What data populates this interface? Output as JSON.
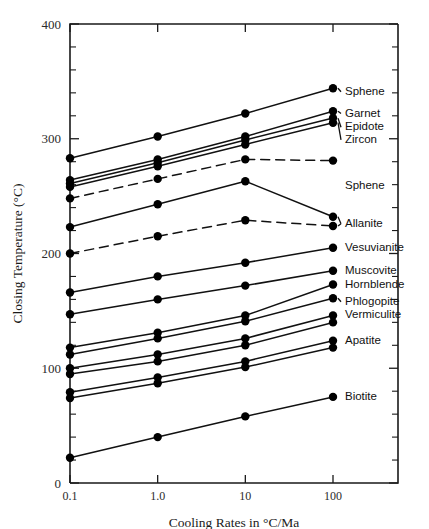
{
  "chart_data": {
    "type": "line",
    "title": "",
    "xlabel": "Cooling Rates in °C/Ma",
    "ylabel": "Closing Temperature (°C)",
    "xscale": "log",
    "xlim": [
      0.1,
      100
    ],
    "ylim": [
      0,
      400
    ],
    "x": [
      0.1,
      1.0,
      10,
      100
    ],
    "xticks": [
      "0.1",
      "1.0",
      "10",
      "100"
    ],
    "yticks": [
      "0",
      "100",
      "200",
      "300",
      "400"
    ],
    "ytick_values": [
      0,
      100,
      200,
      300,
      400
    ],
    "y_minor_interval": 20,
    "grid": false,
    "legend": "right-inline-labels",
    "series": [
      {
        "name": "Sphene",
        "label": "Sphene",
        "style": "solid",
        "values": [
          283,
          302,
          322,
          344
        ],
        "label_y": 341,
        "leader": true
      },
      {
        "name": "Garnet",
        "label": "Garnet",
        "style": "solid",
        "values": [
          264,
          282,
          302,
          324
        ],
        "label_y": 322,
        "leader": true
      },
      {
        "name": "Epidote",
        "label": "Epidote",
        "style": "solid",
        "values": [
          261,
          279,
          299,
          318
        ],
        "label_y": 310,
        "leader": true
      },
      {
        "name": "Zircon",
        "label": "Zircon",
        "style": "solid",
        "values": [
          258,
          276,
          295,
          314
        ],
        "label_y": 299,
        "leader": true
      },
      {
        "name": "Sphene-2",
        "label": "Sphene",
        "style": "dashed",
        "values": [
          248,
          265,
          282,
          281
        ],
        "label_y": 259,
        "leader": false
      },
      {
        "name": "Allanite-hi",
        "label": "Allanite",
        "style": "solid",
        "values": [
          223,
          243,
          263,
          232
        ],
        "label_y": 226,
        "leader": true
      },
      {
        "name": "Allanite-lo",
        "label": "",
        "style": "dashed",
        "values": [
          200,
          215,
          229,
          224
        ],
        "label_y": 0,
        "leader": false
      },
      {
        "name": "Vesuvianite",
        "label": "Vesuvianite",
        "style": "solid",
        "values": [
          166,
          180,
          192,
          205
        ],
        "label_y": 205,
        "leader": false
      },
      {
        "name": "Muscovite",
        "label": "Muscovite",
        "style": "solid",
        "values": [
          147,
          160,
          172,
          185
        ],
        "label_y": 185,
        "leader": false
      },
      {
        "name": "Hornblende",
        "label": "Hornblende",
        "style": "solid",
        "values": [
          118,
          131,
          146,
          173
        ],
        "label_y": 173,
        "leader": false
      },
      {
        "name": "Phlogopite",
        "label": "Phlogopite",
        "style": "solid",
        "values": [
          112,
          126,
          141,
          161
        ],
        "label_y": 158,
        "leader": true
      },
      {
        "name": "Vermiculite",
        "label": "Vermiculite",
        "style": "solid",
        "values": [
          100,
          112,
          126,
          146
        ],
        "label_y": 146,
        "leader": false
      },
      {
        "name": "Vermiculite-2",
        "label": "",
        "style": "solid",
        "values": [
          95,
          106,
          120,
          140
        ],
        "label_y": 0,
        "leader": false
      },
      {
        "name": "Apatite",
        "label": "Apatite",
        "style": "solid",
        "values": [
          79,
          92,
          106,
          124
        ],
        "label_y": 124,
        "leader": false
      },
      {
        "name": "Apatite-2",
        "label": "",
        "style": "solid",
        "values": [
          74,
          87,
          101,
          118
        ],
        "label_y": 0,
        "leader": false
      },
      {
        "name": "Biotite",
        "label": "Biotite",
        "style": "solid",
        "values": [
          22,
          40,
          58,
          75
        ],
        "label_y": 75,
        "leader": false
      }
    ]
  },
  "axes": {
    "y_title": "Closing Temperature (°C)",
    "x_title": "Cooling Rates in °C/Ma",
    "y_labels": [
      "400",
      "300",
      "200",
      "100",
      "0"
    ],
    "x_labels": [
      "0.1",
      "1.0",
      "10",
      "100"
    ]
  }
}
